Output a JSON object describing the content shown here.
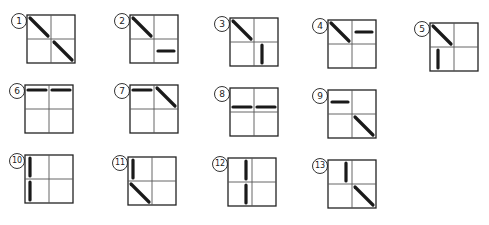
{
  "diagram": {
    "stroke_color": "#1a1a1a",
    "grid_color": "#555555",
    "items": [
      {
        "label": "1",
        "x": 27,
        "y": 15,
        "strokes": [
          [
            "d",
            0
          ],
          [
            "d",
            3
          ]
        ]
      },
      {
        "label": "2",
        "x": 130,
        "y": 15,
        "strokes": [
          [
            "d",
            0
          ],
          [
            "h",
            3
          ]
        ]
      },
      {
        "label": "3",
        "x": 230,
        "y": 18,
        "strokes": [
          [
            "d",
            0
          ],
          [
            "v",
            3
          ]
        ]
      },
      {
        "label": "4",
        "x": 328,
        "y": 20,
        "strokes": [
          [
            "d",
            0
          ],
          [
            "h",
            1
          ]
        ]
      },
      {
        "label": "5",
        "x": 430,
        "y": 23,
        "strokes": [
          [
            "d",
            0
          ],
          [
            "v",
            2
          ]
        ]
      },
      {
        "label": "6",
        "x": 25,
        "y": 85,
        "strokes": [
          [
            "ht",
            0
          ],
          [
            "ht",
            1
          ]
        ]
      },
      {
        "label": "7",
        "x": 130,
        "y": 85,
        "strokes": [
          [
            "ht",
            0
          ],
          [
            "d",
            1
          ]
        ]
      },
      {
        "label": "8",
        "x": 230,
        "y": 88,
        "strokes": [
          [
            "hb",
            0
          ],
          [
            "hb",
            1
          ]
        ]
      },
      {
        "label": "9",
        "x": 328,
        "y": 90,
        "strokes": [
          [
            "h",
            0
          ],
          [
            "d",
            3
          ]
        ]
      },
      {
        "label": "10",
        "x": 25,
        "y": 155,
        "strokes": [
          [
            "vl",
            0
          ],
          [
            "vl",
            2
          ]
        ]
      },
      {
        "label": "11",
        "x": 128,
        "y": 157,
        "strokes": [
          [
            "vl",
            0
          ],
          [
            "d",
            2
          ]
        ]
      },
      {
        "label": "12",
        "x": 228,
        "y": 158,
        "strokes": [
          [
            "vr",
            0
          ],
          [
            "vr",
            2
          ]
        ]
      },
      {
        "label": "13",
        "x": 328,
        "y": 160,
        "strokes": [
          [
            "vr",
            0
          ],
          [
            "d",
            3
          ]
        ]
      }
    ]
  }
}
